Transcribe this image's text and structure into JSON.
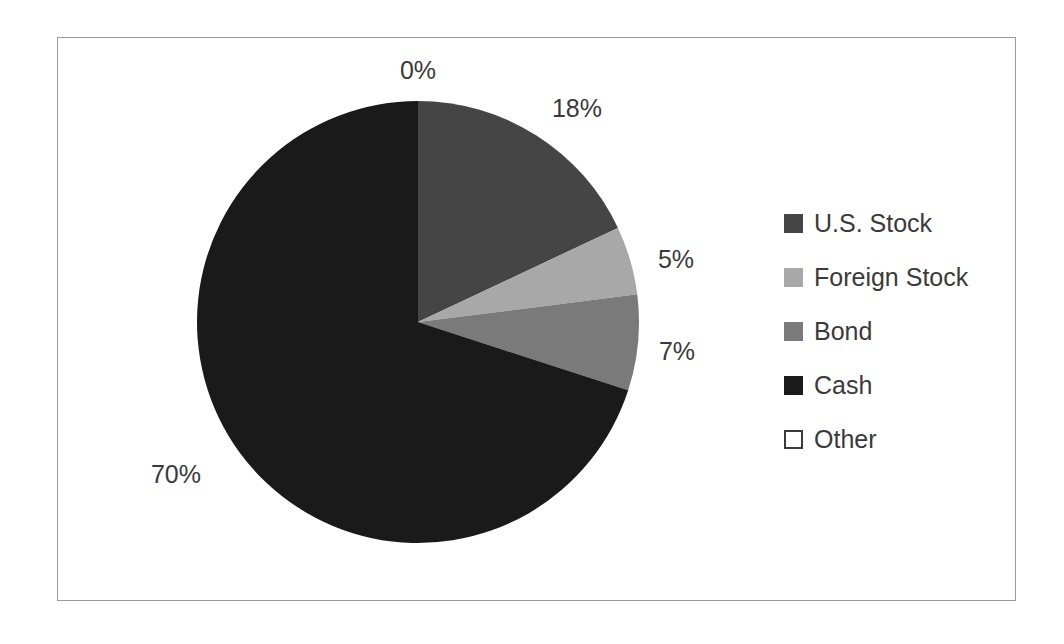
{
  "chart_data": {
    "type": "pie",
    "title": "",
    "subtitle": "",
    "xlabel": "",
    "ylabel": "",
    "grid": false,
    "legend_position": "right",
    "start_angle_deg": 0,
    "direction": "clockwise",
    "categories": [
      "U.S. Stock",
      "Foreign Stock",
      "Bond",
      "Cash",
      "Other"
    ],
    "values": [
      18,
      5,
      7,
      70,
      0
    ],
    "value_labels": [
      "18%",
      "5%",
      "7%",
      "70%",
      "0%"
    ],
    "units": "percent",
    "colors": [
      "#454545",
      "#a8a8a8",
      "#7a7a7a",
      "#1a1a1a",
      "#ffffff"
    ],
    "slices": [
      {
        "label": "U.S. Stock",
        "value": 18,
        "display": "18%",
        "color": "#454545",
        "outline": "none"
      },
      {
        "label": "Foreign Stock",
        "value": 5,
        "display": "5%",
        "color": "#a8a8a8",
        "outline": "none"
      },
      {
        "label": "Bond",
        "value": 7,
        "display": "7%",
        "color": "#7a7a7a",
        "outline": "none"
      },
      {
        "label": "Cash",
        "value": 70,
        "display": "70%",
        "color": "#1a1a1a",
        "outline": "none"
      },
      {
        "label": "Other",
        "value": 0,
        "display": "0%",
        "color": "#ffffff",
        "outline": "#3a3a3a"
      }
    ]
  },
  "labels": {
    "other": "0%",
    "us_stock": "18%",
    "foreign_stock": "5%",
    "bond": "7%",
    "cash": "70%"
  },
  "legend": {
    "items": [
      {
        "label": "U.S. Stock",
        "color": "#454545",
        "outline": "none"
      },
      {
        "label": "Foreign Stock",
        "color": "#a8a8a8",
        "outline": "none"
      },
      {
        "label": "Bond",
        "color": "#7a7a7a",
        "outline": "none"
      },
      {
        "label": "Cash",
        "color": "#1a1a1a",
        "outline": "none"
      },
      {
        "label": "Other",
        "color": "#ffffff",
        "outline": "#3a3a3a"
      }
    ]
  },
  "style": {
    "background": "#ffffff",
    "frame_border": "#9a9a9a",
    "text_color": "#3a3a3a"
  }
}
